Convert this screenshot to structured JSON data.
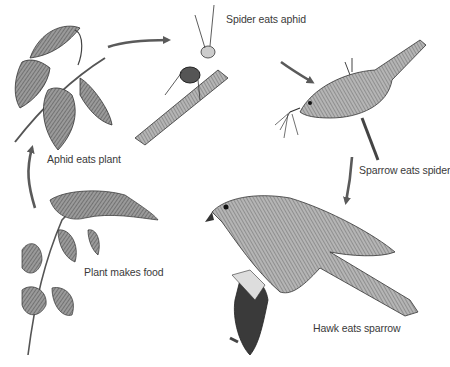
{
  "diagram": {
    "type": "food-chain",
    "stages": [
      {
        "id": "plant",
        "label": "Plant makes food"
      },
      {
        "id": "aphid",
        "label": "Aphid eats plant"
      },
      {
        "id": "spider",
        "label": "Spider eats aphid"
      },
      {
        "id": "sparrow",
        "label": "Sparrow eats spider"
      },
      {
        "id": "hawk",
        "label": "Hawk eats sparrow"
      }
    ],
    "arrows": [
      {
        "from": "plant",
        "to": "aphid"
      },
      {
        "from": "aphid",
        "to": "spider"
      },
      {
        "from": "spider",
        "to": "sparrow"
      },
      {
        "from": "sparrow",
        "to": "hawk"
      }
    ],
    "colors": {
      "arrow": "#5a5a5a",
      "ink": "#2e2e2e",
      "leaf": "#8a8a8a",
      "text": "#3a3a3a"
    }
  }
}
